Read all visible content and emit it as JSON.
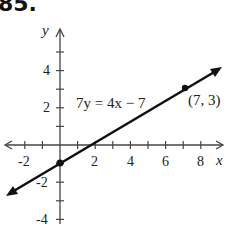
{
  "problem": {
    "number": "85."
  },
  "chart_data": {
    "type": "line",
    "title": "",
    "equation_label": "7y = 4x − 7",
    "xlabel": "x",
    "ylabel": "y",
    "xlim": [
      -2.5,
      9
    ],
    "ylim": [
      -4.3,
      5.5
    ],
    "x_tick_labels": [
      "-2",
      "2",
      "4",
      "6",
      "8"
    ],
    "y_tick_labels": [
      "4",
      "2",
      "-2",
      "-4"
    ],
    "x_ticks": [
      -2,
      -1,
      1,
      2,
      3,
      4,
      5,
      6,
      7,
      8
    ],
    "y_ticks": [
      -4,
      -3,
      -2,
      -1,
      1,
      2,
      3,
      4,
      5
    ],
    "grid": false,
    "series": [
      {
        "name": "7y = 4x - 7",
        "slope": 0.5714,
        "intercept": -1,
        "x": [
          -2.95,
          9.0
        ],
        "y": [
          -2.69,
          4.14
        ],
        "arrows_both_ends": true
      }
    ],
    "points": [
      {
        "x": 0,
        "y": -1,
        "label": ""
      },
      {
        "x": 7,
        "y": 3,
        "label": "(7, 3)"
      }
    ],
    "colors": {
      "line": "#111111",
      "axis": "#444444"
    }
  }
}
